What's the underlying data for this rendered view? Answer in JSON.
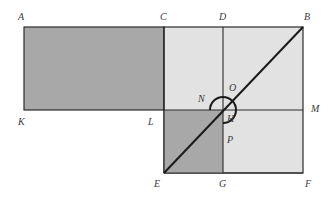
{
  "diagram": {
    "colors": {
      "dark_fill": "#a8a8a8",
      "light_fill": "#e2e2e2",
      "stroke": "#2a2a2a",
      "label": "#3a3a3a"
    },
    "points": {
      "A": {
        "label": "A",
        "x": 24,
        "y": 27
      },
      "C": {
        "label": "C",
        "x": 164,
        "y": 27
      },
      "D": {
        "label": "D",
        "x": 223,
        "y": 27
      },
      "B": {
        "label": "B",
        "x": 303,
        "y": 27
      },
      "K": {
        "label": "K",
        "x": 24,
        "y": 110
      },
      "L": {
        "label": "L",
        "x": 164,
        "y": 110
      },
      "H": {
        "label": "H",
        "x": 223,
        "y": 110
      },
      "M": {
        "label": "M",
        "x": 303,
        "y": 110
      },
      "E": {
        "label": "E",
        "x": 164,
        "y": 173
      },
      "G": {
        "label": "G",
        "x": 223,
        "y": 173
      },
      "F": {
        "label": "F",
        "x": 303,
        "y": 173
      },
      "N": {
        "label": "N"
      },
      "O": {
        "label": "O"
      },
      "P": {
        "label": "P"
      }
    },
    "regions": [
      {
        "name": "rectangle-AKLC",
        "fill": "dark"
      },
      {
        "name": "square-CBFE",
        "fill": "light"
      },
      {
        "name": "square-LHGE",
        "fill": "dark"
      }
    ],
    "segments": [
      "AC",
      "CB",
      "AK",
      "KL",
      "CE",
      "DG",
      "LM",
      "BF",
      "EF",
      "EB"
    ],
    "arc": {
      "name": "gnomon-arc-NOP",
      "center": "H"
    }
  }
}
